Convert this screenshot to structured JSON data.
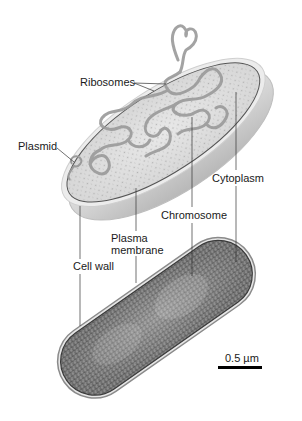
{
  "figure": {
    "labels": {
      "ribosomes": "Ribosomes",
      "plasmid": "Plasmid",
      "cytoplasm": "Cytoplasm",
      "chromosome": "Chromosome",
      "plasma_membrane_line1": "Plasma",
      "plasma_membrane_line2": "membrane",
      "cell_wall": "Cell wall"
    },
    "scale_bar": {
      "label": "0.5 µm"
    },
    "panels": [
      {
        "name": "illustration",
        "description": "Cutaway drawing of rod-shaped bacterium"
      },
      {
        "name": "micrograph",
        "description": "Electron micrograph of bacterium"
      }
    ],
    "colors": {
      "label_text": "#1a1a1a",
      "leader_line": "#333333",
      "cell_outer": "#d6d6d6",
      "cytoplasm_fill": "#dedede",
      "chromosome_strand": "#9a9a9a",
      "micrograph_dark": "#5a5a5a",
      "scale_bar": "#000000"
    }
  }
}
